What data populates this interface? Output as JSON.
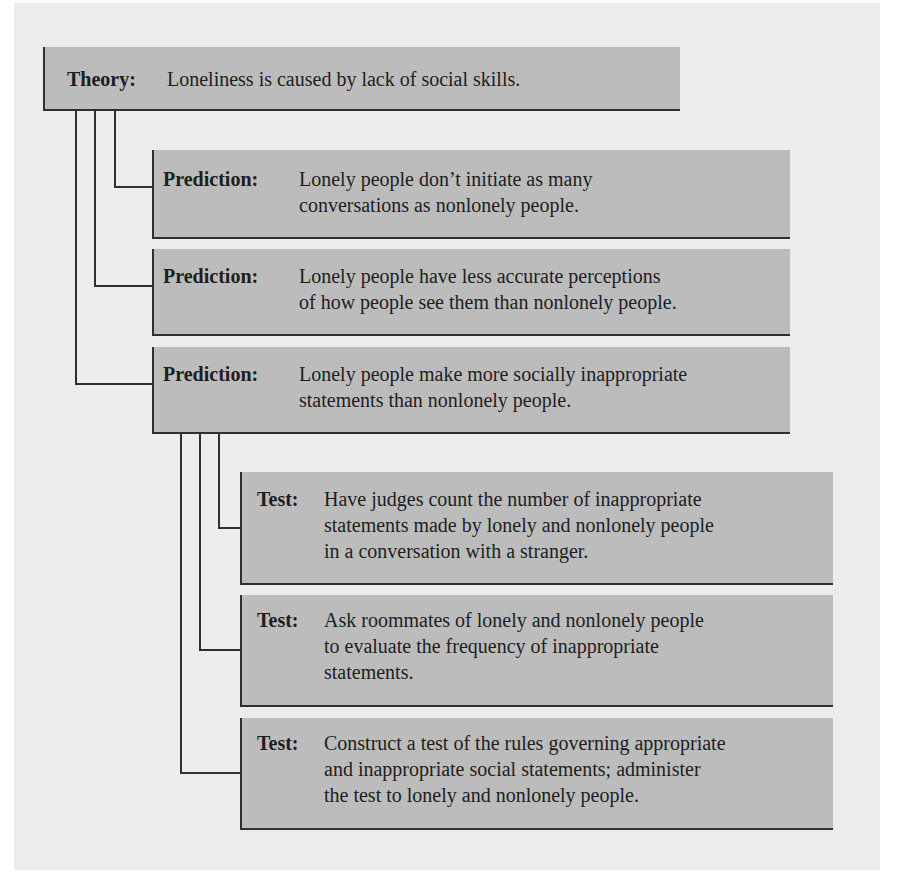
{
  "diagram": {
    "theory": {
      "label": "Theory:",
      "text": [
        "Loneliness is caused by lack of social skills."
      ]
    },
    "predictions": [
      {
        "label": "Prediction:",
        "text": [
          "Lonely people don’t initiate as many",
          "conversations as nonlonely people."
        ]
      },
      {
        "label": "Prediction:",
        "text": [
          "Lonely people have less accurate perceptions",
          "of how people see them than nonlonely people."
        ]
      },
      {
        "label": "Prediction:",
        "text": [
          "Lonely people make more socially inappropriate",
          "statements than nonlonely people."
        ]
      }
    ],
    "tests": [
      {
        "label": "Test:",
        "text": [
          "Have judges count the number of inappropriate",
          "statements made by lonely and nonlonely people",
          "in a conversation with a stranger."
        ]
      },
      {
        "label": "Test:",
        "text": [
          "Ask roommates of lonely and nonlonely people",
          "to evaluate the frequency of inappropriate",
          "statements."
        ]
      },
      {
        "label": "Test:",
        "text": [
          "Construct a test of the rules governing appropriate",
          "and inappropriate social statements; administer",
          "the test to lonely and nonlonely people."
        ]
      }
    ],
    "colors": {
      "panel_background": "#ececec",
      "box_fill": "#bcbcbc",
      "line": "#2f2f2f"
    }
  }
}
